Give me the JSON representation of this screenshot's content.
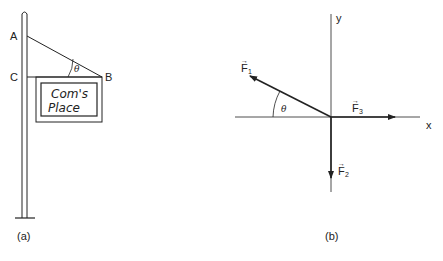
{
  "figure_a": {
    "caption": "(a)",
    "points": {
      "A": "A",
      "B": "B",
      "C": "C"
    },
    "angle_label": "θ",
    "sign_text": {
      "line1": "Com's",
      "line2": "Place"
    }
  },
  "figure_b": {
    "caption": "(b)",
    "axes": {
      "x": "x",
      "y": "y"
    },
    "angle_label": "θ",
    "forces": [
      {
        "name": "F",
        "subscript": "1",
        "direction": "up-left"
      },
      {
        "name": "F",
        "subscript": "2",
        "direction": "down"
      },
      {
        "name": "F",
        "subscript": "3",
        "direction": "right"
      }
    ],
    "vector_arrow": "→"
  },
  "colors": {
    "ink": "#222222",
    "background": "#ffffff"
  }
}
